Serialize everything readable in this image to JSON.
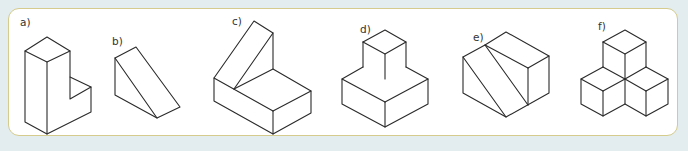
{
  "colors": {
    "background": "#e3edef",
    "panel_fill": "#ffffff",
    "panel_border": "#d4cb8c",
    "line": "#2a2a2a"
  },
  "figures": [
    {
      "id": "a",
      "label": "a)",
      "description": "L-shaped block (tall column with a low step to the right)"
    },
    {
      "id": "b",
      "label": "b)",
      "description": "triangular prism / wedge"
    },
    {
      "id": "c",
      "label": "c)",
      "description": "rectangular slab with a wedge on top at the back"
    },
    {
      "id": "d",
      "label": "d)",
      "description": "small cube stacked on a larger square slab"
    },
    {
      "id": "e",
      "label": "e)",
      "description": "hexagonal block with two diagonal cut lines on the left face"
    },
    {
      "id": "f",
      "label": "f)",
      "description": "four cubes arranged in a pyramid: one on top of three"
    }
  ]
}
